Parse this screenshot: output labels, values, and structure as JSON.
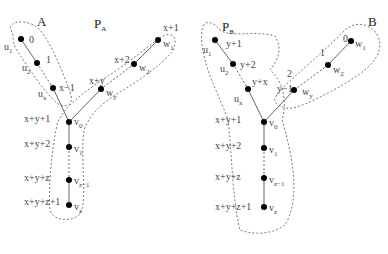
{
  "left_tree": {
    "region_labels": [
      {
        "id": "A",
        "text": "A",
        "x": 37,
        "y": 26
      },
      {
        "id": "PA",
        "text": "P",
        "sub": "A",
        "x": 94,
        "y": 28
      }
    ],
    "nodes": [
      {
        "id": "u1",
        "x": 21,
        "y": 39,
        "name": "u",
        "sub": "1",
        "nx": 4,
        "ny": 50,
        "weight": "0",
        "wx": 29,
        "wy": 43
      },
      {
        "id": "u2",
        "x": 37,
        "y": 63,
        "name": "u",
        "sub": "2",
        "nx": 22,
        "ny": 71,
        "weight": "1",
        "wx": 46,
        "wy": 63
      },
      {
        "id": "ux",
        "x": 53,
        "y": 88,
        "name": "u",
        "sub": "x",
        "nx": 38,
        "ny": 97,
        "weight": "x−1",
        "wx": 59,
        "wy": 91
      },
      {
        "id": "w1",
        "x": 158,
        "y": 40,
        "name": "w",
        "sub": "1",
        "nx": 163,
        "ny": 47,
        "weight": "x+1",
        "wx": 163,
        "wy": 31
      },
      {
        "id": "w2",
        "x": 134,
        "y": 64,
        "name": "w",
        "sub": "2",
        "nx": 139,
        "ny": 71,
        "weight": "x+2",
        "wx": 114,
        "wy": 63
      },
      {
        "id": "wy",
        "x": 101,
        "y": 89,
        "name": "w",
        "sub": "y",
        "nx": 106,
        "ny": 96,
        "weight": "x+y",
        "wx": 89,
        "wy": 84
      },
      {
        "id": "v0",
        "x": 69,
        "y": 122,
        "name": "v",
        "sub": "0",
        "nx": 74,
        "ny": 125,
        "weight": "x+y+1",
        "wx": 24,
        "wy": 122
      },
      {
        "id": "v1",
        "x": 69,
        "y": 147,
        "name": "v",
        "sub": "1",
        "nx": 74,
        "ny": 152,
        "weight": "x+y+2",
        "wx": 24,
        "wy": 147
      },
      {
        "id": "vz1",
        "x": 69,
        "y": 180,
        "name": "v",
        "sub": "z−1",
        "nx": 74,
        "ny": 184,
        "weight": "x+y+z",
        "wx": 24,
        "wy": 181
      },
      {
        "id": "vz",
        "x": 69,
        "y": 205,
        "name": "v",
        "sub": "z",
        "nx": 74,
        "ny": 210,
        "weight": "x+y+z+1",
        "wx": 24,
        "wy": 205
      }
    ],
    "solid_edges": [
      [
        "u1",
        "u2"
      ],
      [
        "ux",
        "v0"
      ],
      [
        "w1",
        "w2"
      ],
      [
        "wy",
        "v0"
      ],
      [
        "v0",
        "v1"
      ],
      [
        "vz1",
        "vz"
      ]
    ],
    "dashed_edges": [
      [
        "u2",
        "ux"
      ],
      [
        "w2",
        "wy"
      ],
      [
        "v1",
        "vz1"
      ]
    ]
  },
  "right_tree": {
    "region_labels": [
      {
        "id": "PB",
        "text": "P",
        "sub": "B",
        "x": 222,
        "y": 31
      },
      {
        "id": "B",
        "text": "B",
        "x": 368,
        "y": 26
      }
    ],
    "nodes": [
      {
        "id": "u1",
        "x": 215,
        "y": 40,
        "name": "u",
        "sub": "1",
        "nx": 203,
        "ny": 53,
        "weight": "y+1",
        "wx": 226,
        "wy": 47
      },
      {
        "id": "u2",
        "x": 233,
        "y": 64,
        "name": "u",
        "sub": "2",
        "nx": 220,
        "ny": 72,
        "weight": "y+2",
        "wx": 240,
        "wy": 68
      },
      {
        "id": "ux",
        "x": 248,
        "y": 89,
        "name": "u",
        "sub": "x",
        "nx": 234,
        "ny": 102,
        "weight": "y+x",
        "wx": 252,
        "wy": 85
      },
      {
        "id": "w1",
        "x": 351,
        "y": 41,
        "name": "w",
        "sub": "1",
        "nx": 355,
        "ny": 47,
        "weight": "0",
        "wx": 343,
        "wy": 42
      },
      {
        "id": "w2",
        "x": 328,
        "y": 65,
        "name": "w",
        "sub": "2",
        "nx": 333,
        "ny": 73,
        "weight": "1",
        "wx": 320,
        "wy": 56
      },
      {
        "id": "wy",
        "x": 294,
        "y": 90,
        "name": "w",
        "sub": "y",
        "nx": 302,
        "ny": 95,
        "weight": "y−1",
        "wx": 277,
        "wy": 92
      },
      {
        "id": "v0",
        "x": 264,
        "y": 122,
        "name": "v",
        "sub": "0",
        "nx": 269,
        "ny": 126,
        "weight": "x+y+1",
        "wx": 215,
        "wy": 123
      },
      {
        "id": "v1",
        "x": 264,
        "y": 148,
        "name": "v",
        "sub": "1",
        "nx": 269,
        "ny": 153,
        "weight": "x+y+2",
        "wx": 215,
        "wy": 149
      },
      {
        "id": "vz1",
        "x": 264,
        "y": 178,
        "name": "v",
        "sub": "z−1",
        "nx": 269,
        "ny": 183,
        "weight": "x+y+z",
        "wx": 215,
        "wy": 180
      },
      {
        "id": "vz",
        "x": 264,
        "y": 207,
        "name": "v",
        "sub": "z",
        "nx": 269,
        "ny": 211,
        "weight": "x+y+z+1",
        "wx": 215,
        "wy": 210
      }
    ],
    "solid_edges": [
      [
        "u1",
        "u2"
      ],
      [
        "ux",
        "v0"
      ],
      [
        "w1",
        "w2"
      ],
      [
        "wy",
        "v0"
      ],
      [
        "v0",
        "v1"
      ],
      [
        "vz1",
        "vz"
      ]
    ],
    "dashed_edges": [
      [
        "u2",
        "ux"
      ],
      [
        "w2",
        "wy"
      ],
      [
        "v1",
        "vz1"
      ]
    ],
    "extra_labels": [
      {
        "text": "2",
        "x": 287,
        "y": 77
      }
    ]
  },
  "regions": {
    "left_A": "M12,32 C4,20 30,18 40,30 C52,45 62,70 70,92 C75,106 66,108 58,104 C44,92 30,70 18,52 C12,44 14,38 12,32 Z",
    "left_PA": "M60,118 C70,100 95,85 120,68 C140,54 155,40 165,35 C175,32 178,42 172,52 C160,66 140,80 120,92 C100,104 90,115 84,130 C80,160 88,200 80,214 C72,222 54,222 50,210 C48,190 52,150 56,130 C57,124 58,120 60,118 Z",
    "right_PB": "M203,26 C206,20 214,22 220,30 C230,38 255,30 275,36 C283,50 278,60 270,70 C282,80 288,100 282,120 C294,160 300,200 285,225 C270,236 250,234 240,230 C232,200 232,150 228,120 C222,102 210,80 205,60 C202,48 200,36 203,26 Z",
    "right_B": "M276,96 C290,78 320,56 345,30 C358,18 378,26 380,44 C380,62 360,76 330,92 C310,102 295,110 286,108 C278,106 272,102 276,96 Z"
  }
}
